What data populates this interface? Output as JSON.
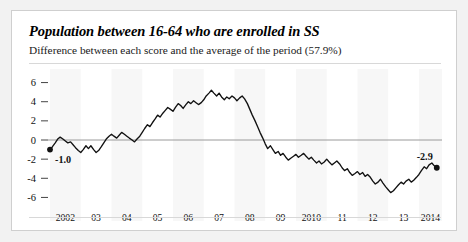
{
  "header": {
    "title": "Population between 16-64 who are enrolled in SS",
    "subtitle": "Difference between each score and the average of the period (57.9%)"
  },
  "chart_data": {
    "type": "line",
    "title": "Population between 16-64 who are enrolled in SS",
    "subtitle": "Difference between each score and the average of the period (57.9%)",
    "xlabel": "",
    "ylabel": "",
    "ylim": [
      -7,
      7
    ],
    "yticks": [
      6,
      4,
      2,
      0,
      -2,
      -4,
      -6
    ],
    "ytick_labels": [
      "6",
      "4",
      "2",
      "0",
      "-2",
      "-4",
      "-6"
    ],
    "xtick_labels": [
      "2002",
      "03",
      "04",
      "05",
      "06",
      "07",
      "08",
      "09",
      "2010",
      "11",
      "12",
      "13",
      "2014"
    ],
    "xlim": [
      2002.0,
      2014.75
    ],
    "grid": false,
    "zero_line": true,
    "legend": "none",
    "series": [
      {
        "name": "Difference from period average",
        "x": [
          2002.0,
          2002.08,
          2002.17,
          2002.25,
          2002.33,
          2002.42,
          2002.5,
          2002.58,
          2002.67,
          2002.75,
          2002.83,
          2002.92,
          2003.0,
          2003.08,
          2003.17,
          2003.25,
          2003.33,
          2003.42,
          2003.5,
          2003.58,
          2003.67,
          2003.75,
          2003.83,
          2003.92,
          2004.0,
          2004.08,
          2004.17,
          2004.25,
          2004.33,
          2004.42,
          2004.5,
          2004.58,
          2004.67,
          2004.75,
          2004.83,
          2004.92,
          2005.0,
          2005.08,
          2005.17,
          2005.25,
          2005.33,
          2005.42,
          2005.5,
          2005.58,
          2005.67,
          2005.75,
          2005.83,
          2005.92,
          2006.0,
          2006.08,
          2006.17,
          2006.25,
          2006.33,
          2006.42,
          2006.5,
          2006.58,
          2006.67,
          2006.75,
          2006.83,
          2006.92,
          2007.0,
          2007.08,
          2007.17,
          2007.25,
          2007.33,
          2007.42,
          2007.5,
          2007.58,
          2007.67,
          2007.75,
          2007.83,
          2007.92,
          2008.0,
          2008.08,
          2008.17,
          2008.25,
          2008.33,
          2008.42,
          2008.5,
          2008.58,
          2008.67,
          2008.75,
          2008.83,
          2008.92,
          2009.0,
          2009.08,
          2009.17,
          2009.25,
          2009.33,
          2009.42,
          2009.5,
          2009.58,
          2009.67,
          2009.75,
          2009.83,
          2009.92,
          2010.0,
          2010.08,
          2010.17,
          2010.25,
          2010.33,
          2010.42,
          2010.5,
          2010.58,
          2010.67,
          2010.75,
          2010.83,
          2010.92,
          2011.0,
          2011.08,
          2011.17,
          2011.25,
          2011.33,
          2011.42,
          2011.5,
          2011.58,
          2011.67,
          2011.75,
          2011.83,
          2011.92,
          2012.0,
          2012.08,
          2012.17,
          2012.25,
          2012.33,
          2012.42,
          2012.5,
          2012.58,
          2012.67,
          2012.75,
          2012.83,
          2012.92,
          2013.0,
          2013.08,
          2013.17,
          2013.25,
          2013.33,
          2013.42,
          2013.5,
          2013.58,
          2013.67,
          2013.75,
          2013.83,
          2013.92,
          2014.0,
          2014.08,
          2014.17,
          2014.25,
          2014.33,
          2014.42,
          2014.5,
          2014.58
        ],
        "values": [
          -1.0,
          -0.7,
          -0.3,
          0.1,
          0.3,
          0.1,
          -0.1,
          -0.3,
          -0.2,
          -0.5,
          -0.8,
          -1.1,
          -1.3,
          -1.0,
          -0.6,
          -0.9,
          -0.6,
          -1.0,
          -1.3,
          -1.1,
          -0.7,
          -0.3,
          0.1,
          0.4,
          0.6,
          0.4,
          0.2,
          0.5,
          0.8,
          0.6,
          0.4,
          0.2,
          0.0,
          -0.2,
          0.1,
          0.4,
          0.8,
          1.2,
          1.6,
          1.4,
          1.8,
          2.2,
          2.6,
          2.4,
          2.8,
          3.1,
          3.4,
          3.2,
          3.0,
          3.4,
          3.8,
          3.6,
          3.3,
          3.7,
          4.0,
          3.8,
          4.1,
          3.9,
          3.7,
          3.9,
          4.2,
          4.6,
          4.9,
          5.2,
          4.9,
          4.6,
          4.9,
          4.5,
          4.2,
          4.5,
          4.3,
          4.6,
          4.4,
          4.1,
          4.4,
          4.6,
          4.3,
          3.8,
          3.2,
          2.6,
          2.0,
          1.4,
          0.8,
          0.2,
          -0.4,
          -0.9,
          -0.6,
          -1.0,
          -1.4,
          -1.2,
          -1.6,
          -1.4,
          -1.8,
          -2.1,
          -1.9,
          -1.7,
          -1.5,
          -1.8,
          -1.6,
          -1.4,
          -1.7,
          -2.0,
          -1.8,
          -2.1,
          -2.4,
          -2.2,
          -2.5,
          -2.3,
          -2.0,
          -2.3,
          -2.6,
          -2.4,
          -2.2,
          -2.5,
          -2.9,
          -3.2,
          -3.0,
          -3.4,
          -3.7,
          -3.5,
          -3.3,
          -3.6,
          -3.4,
          -3.8,
          -3.6,
          -3.9,
          -4.3,
          -4.6,
          -4.4,
          -4.1,
          -4.5,
          -4.9,
          -5.2,
          -5.5,
          -5.3,
          -5.0,
          -4.7,
          -4.4,
          -4.6,
          -4.3,
          -4.1,
          -4.4,
          -4.2,
          -3.9,
          -3.6,
          -3.2,
          -2.8,
          -3.0,
          -2.6,
          -2.4,
          -2.7,
          -2.9
        ]
      }
    ],
    "annotations": [
      {
        "id": "start-value",
        "label": "-1.0",
        "x": 2002.0,
        "y": -1.0,
        "marker": true
      },
      {
        "id": "end-value",
        "label": "-2.9",
        "x": 2014.58,
        "y": -2.9,
        "marker": true
      }
    ]
  }
}
